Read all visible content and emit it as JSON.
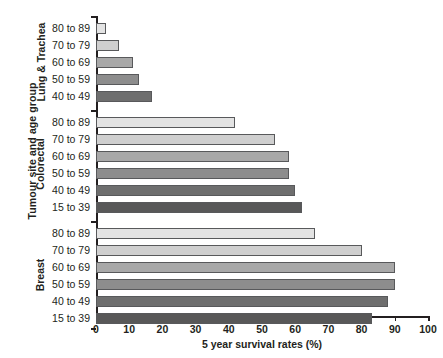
{
  "chart_data": {
    "type": "bar",
    "orientation": "horizontal",
    "title": "",
    "xlabel": "5 year survival rates (%)",
    "ylabel": "Tumour site and age group",
    "xlim": [
      0,
      100
    ],
    "xticks": [
      0,
      10,
      20,
      30,
      40,
      50,
      60,
      70,
      80,
      90,
      100
    ],
    "grid": false,
    "legend": "none",
    "groups": [
      {
        "name": "Lung & Trachea",
        "categories": [
          "80 to 89",
          "70 to 79",
          "60 to 69",
          "50 to 59",
          "40 to 49"
        ],
        "values": [
          3,
          7,
          11,
          13,
          17
        ],
        "colors": [
          "#e3e3e3",
          "#cfcfcf",
          "#a8a8a8",
          "#8d8d8d",
          "#6e6e6e"
        ]
      },
      {
        "name": "Colorectal",
        "categories": [
          "80 to 89",
          "70 to 79",
          "60 to 69",
          "50 to 59",
          "40 to 49",
          "15 to 39"
        ],
        "values": [
          42,
          54,
          58,
          58,
          60,
          62
        ],
        "colors": [
          "#e3e3e3",
          "#cfcfcf",
          "#a8a8a8",
          "#8d8d8d",
          "#6e6e6e",
          "#585858"
        ]
      },
      {
        "name": "Breast",
        "categories": [
          "80 to 89",
          "70 to 79",
          "60 to 69",
          "50 to 59",
          "40 to 49",
          "15 to 39"
        ],
        "values": [
          66,
          80,
          90,
          90,
          88,
          83
        ],
        "colors": [
          "#e3e3e3",
          "#cfcfcf",
          "#a8a8a8",
          "#8d8d8d",
          "#6e6e6e",
          "#585858"
        ]
      }
    ]
  },
  "caption": {
    "text": ""
  }
}
